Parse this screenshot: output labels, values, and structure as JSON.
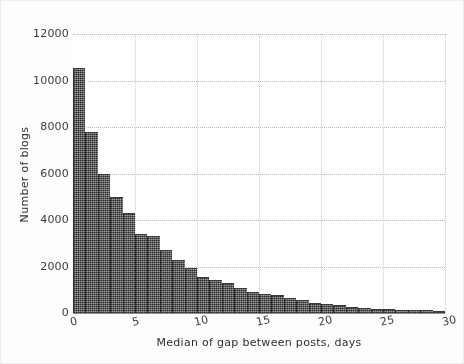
{
  "chart_data": {
    "type": "bar",
    "chart_subtype": "histogram",
    "title": "",
    "xlabel": "Median of gap between posts, days",
    "ylabel": "Number of blogs",
    "xlim": [
      0,
      30
    ],
    "ylim": [
      0,
      12000
    ],
    "bin_width": 1,
    "grid": true,
    "grid_style": "dotted",
    "legend": "none",
    "xticks": [
      0,
      5,
      10,
      15,
      20,
      25,
      30
    ],
    "xtick_labels": [
      "0",
      "5",
      "10",
      "15",
      "20",
      "25",
      "30"
    ],
    "yticks": [
      0,
      2000,
      4000,
      6000,
      8000,
      10000,
      12000
    ],
    "ytick_labels": [
      "0",
      "2000",
      "4000",
      "6000",
      "8000",
      "10000",
      "12000"
    ],
    "bar_color": "#5b5b5b",
    "bar_edge_color": "#2f2f2f",
    "x": [
      0.5,
      1.5,
      2.5,
      3.5,
      4.5,
      5.5,
      6.5,
      7.5,
      8.5,
      9.5,
      10.5,
      11.5,
      12.5,
      13.5,
      14.5,
      15.5,
      16.5,
      17.5,
      18.5,
      19.5,
      20.5,
      21.5,
      22.5,
      23.5,
      24.5,
      25.5,
      26.5,
      27.5,
      28.5,
      29.5
    ],
    "bin_edges": [
      0,
      1,
      2,
      3,
      4,
      5,
      6,
      7,
      8,
      9,
      10,
      11,
      12,
      13,
      14,
      15,
      16,
      17,
      18,
      19,
      20,
      21,
      22,
      23,
      24,
      25,
      26,
      27,
      28,
      29,
      30
    ],
    "categories": [
      "0-1",
      "1-2",
      "2-3",
      "3-4",
      "4-5",
      "5-6",
      "6-7",
      "7-8",
      "8-9",
      "9-10",
      "10-11",
      "11-12",
      "12-13",
      "13-14",
      "14-15",
      "15-16",
      "16-17",
      "17-18",
      "18-19",
      "19-20",
      "20-21",
      "21-22",
      "22-23",
      "23-24",
      "24-25",
      "25-26",
      "26-27",
      "27-28",
      "28-29",
      "29-30"
    ],
    "values": [
      10530,
      7800,
      6000,
      5000,
      4300,
      3420,
      3320,
      2700,
      2280,
      1950,
      1560,
      1400,
      1280,
      1060,
      900,
      800,
      760,
      640,
      580,
      420,
      380,
      330,
      270,
      220,
      190,
      160,
      140,
      120,
      110,
      100
    ]
  },
  "axes": {
    "y_title": "Number of blogs",
    "x_title": "Median of gap between posts, days"
  }
}
